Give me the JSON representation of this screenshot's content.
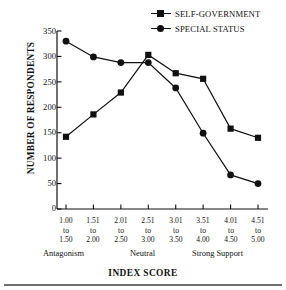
{
  "legend": {
    "entries": [
      {
        "label": "SELF-GOVERNMENT",
        "marker": "square"
      },
      {
        "label": "SPECIAL STATUS",
        "marker": "circle"
      }
    ]
  },
  "axes": {
    "ylabel": "NUMBER OF RESPONDENTS",
    "xlabel": "INDEX SCORE",
    "yticks": [
      "350",
      "300",
      "250",
      "200",
      "150",
      "100",
      "50",
      "0"
    ],
    "category_labels": [
      "Antagonism",
      "Neutral",
      "Strong Support"
    ]
  },
  "chart_data": {
    "type": "line",
    "title": "",
    "xlabel": "INDEX SCORE",
    "ylabel": "NUMBER OF RESPONDENTS",
    "ylim": [
      0,
      350
    ],
    "ytick_step": 50,
    "grid": false,
    "legend_position": "top-right",
    "categories": [
      "1.00 to 1.50",
      "1.51 to 2.00",
      "2.01 to 2.50",
      "2.51 to 3.00",
      "3.01 to 3.50",
      "3.51 to 4.00",
      "4.01 to 4.50",
      "4.51 to 5.00"
    ],
    "category_lines": [
      [
        "1.00",
        "to",
        "1.50"
      ],
      [
        "1.51",
        "to",
        "2.00"
      ],
      [
        "2.01",
        "to",
        "2.50"
      ],
      [
        "2.51",
        "to",
        "3.00"
      ],
      [
        "3.01",
        "to",
        "3.50"
      ],
      [
        "3.51",
        "to",
        "4.00"
      ],
      [
        "4.01",
        "to",
        "4.50"
      ],
      [
        "4.51",
        "to",
        "5.00"
      ]
    ],
    "annotations": [
      "Antagonism",
      "Neutral",
      "Strong Support"
    ],
    "series": [
      {
        "name": "SELF-GOVERNMENT",
        "marker": "square",
        "color": "#111111",
        "values": [
          142,
          186,
          229,
          303,
          267,
          256,
          158,
          140
        ]
      },
      {
        "name": "SPECIAL STATUS",
        "marker": "circle",
        "color": "#111111",
        "values": [
          330,
          299,
          288,
          288,
          238,
          149,
          67,
          50
        ]
      }
    ]
  }
}
